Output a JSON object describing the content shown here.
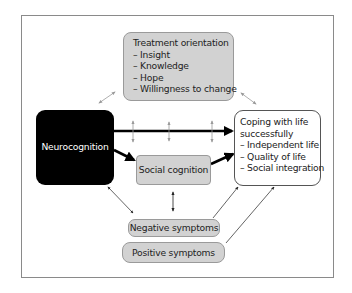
{
  "diagram": {
    "treatment": {
      "title": "Treatment orientation",
      "items": [
        "– Insight",
        "– Knowledge",
        "– Hope",
        "– Willingness to change"
      ]
    },
    "neurocognition": {
      "label": "Neurocognition"
    },
    "coping": {
      "title_line1": "Coping with life",
      "title_line2": "successfully",
      "items": [
        "– Independent life",
        "– Quality of life",
        "– Social integration"
      ]
    },
    "social_cognition": {
      "label": "Social cognition"
    },
    "negative_symptoms": {
      "label": "Negative symptoms"
    },
    "positive_symptoms": {
      "label": "Positive symptoms"
    },
    "colors": {
      "box_grey": "#d2d2d2",
      "neuro_fill": "#000000",
      "arrow_main": "#000000",
      "arrow_light": "#9a9a9a"
    }
  }
}
